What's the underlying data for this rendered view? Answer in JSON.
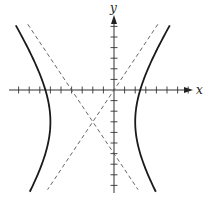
{
  "chart_data": {
    "type": "line",
    "title": "",
    "xlabel": "x",
    "ylabel": "y",
    "grid": false,
    "equation": "(x+2)^2/16 - (y+3)^2/36 = 1",
    "center": [
      -2,
      -3
    ],
    "a": 4,
    "b": 6,
    "vertices": [
      [
        -6,
        -3
      ],
      [
        2,
        -3
      ]
    ],
    "asymptotes": [
      "y = 1.5x",
      "y = -1.5x - 6"
    ],
    "x_ticks": [
      -9,
      -8,
      -7,
      -6,
      -5,
      -4,
      -3,
      -2,
      -1,
      1,
      2,
      3,
      4,
      5,
      6,
      7
    ],
    "y_ticks": [
      6,
      5,
      4,
      3,
      2,
      1,
      -1,
      -2,
      -3,
      -4,
      -5,
      -6,
      -7,
      -8,
      -9
    ],
    "xlim": [
      -9.8,
      7.3
    ],
    "ylim": [
      -9.6,
      6.8
    ],
    "series": [
      {
        "name": "hyperbola-left-branch",
        "style": "solid"
      },
      {
        "name": "hyperbola-right-branch",
        "style": "solid"
      },
      {
        "name": "asymptote-positive-slope",
        "style": "dashed",
        "slope": 1.5,
        "intercept": 0
      },
      {
        "name": "asymptote-negative-slope",
        "style": "dashed",
        "slope": -1.5,
        "intercept": -6
      }
    ]
  },
  "axes": {
    "x_label": "x",
    "y_label": "y"
  },
  "colors": {
    "curve": "#1a1a1a",
    "asymptote": "#555555",
    "axis": "#333333"
  }
}
